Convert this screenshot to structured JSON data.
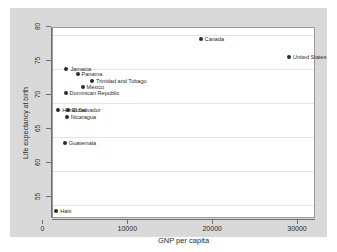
{
  "chart_data": {
    "type": "scatter",
    "title": "",
    "subtitle": "",
    "xlabel": "GNP per capita",
    "ylabel": "Life expectancy at birth",
    "xlim": [
      0,
      31000
    ],
    "ylim": [
      53,
      81
    ],
    "xticks": [
      0,
      10000,
      20000,
      30000
    ],
    "xtick_labels": [
      "0",
      "10000",
      "20000",
      "30000"
    ],
    "yticks": [
      55,
      60,
      65,
      70,
      75,
      80
    ],
    "ytick_labels": [
      "55",
      "60",
      "65",
      "70",
      "75",
      "80"
    ],
    "grid": "horizontal",
    "legend": "none",
    "marker_color": "#2b2b2b",
    "points": [
      {
        "label": "Canada",
        "x": 17400,
        "y": 79.4
      },
      {
        "label": "United States",
        "x": 27800,
        "y": 76.7
      },
      {
        "label": "Jamaica",
        "x": 1580,
        "y": 75.0
      },
      {
        "label": "Panama",
        "x": 2890,
        "y": 74.2
      },
      {
        "label": "Trinidad and Tobago",
        "x": 4600,
        "y": 73.3
      },
      {
        "label": "Mexico",
        "x": 3480,
        "y": 72.4
      },
      {
        "label": "Dominican Republic",
        "x": 1490,
        "y": 71.5
      },
      {
        "label": "Honduras",
        "x": 620,
        "y": 69.0
      },
      {
        "label": "El Salvador",
        "x": 1780,
        "y": 69.0
      },
      {
        "label": "Nicaragua",
        "x": 1620,
        "y": 67.9
      },
      {
        "label": "Guatemala",
        "x": 1390,
        "y": 64.1
      },
      {
        "label": "Haiti",
        "x": 380,
        "y": 54.2
      }
    ]
  },
  "colors": {
    "graph_background": "#d9d9d9",
    "plot_background": "#ffffff",
    "axis": "#6e6e6e",
    "grid": "#e3e3e8",
    "marker": "#2b2b2b",
    "text": "#2b2b2b"
  }
}
